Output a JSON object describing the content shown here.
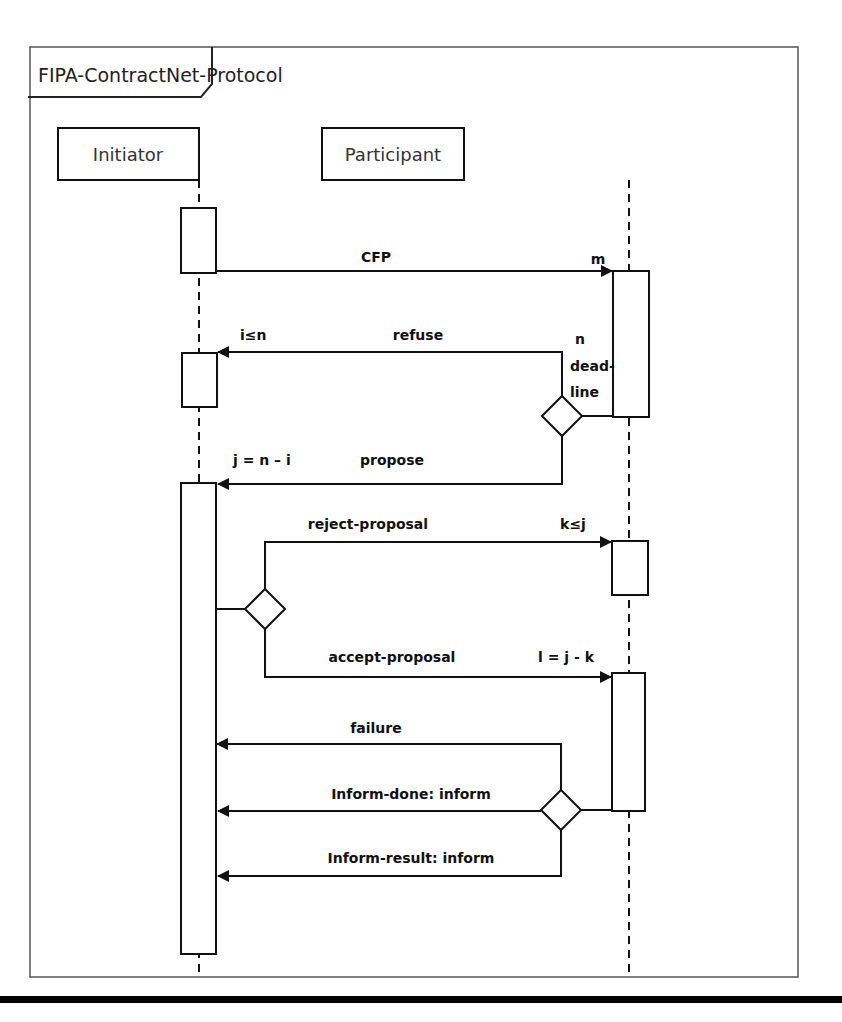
{
  "frame": {
    "title": "FIPA-ContractNet-Protocol"
  },
  "lifelines": [
    {
      "name": "Initiator"
    },
    {
      "name": "Participant"
    }
  ],
  "messages": {
    "cfp": {
      "label": "CFP",
      "multiplicity": "m"
    },
    "refuse": {
      "label": "refuse",
      "guard_left": "i≤n",
      "guard_right": "n"
    },
    "deadline": {
      "line1": "dead-",
      "line2": "line"
    },
    "propose": {
      "label": "propose",
      "guard_left": "j = n – i"
    },
    "reject": {
      "label": "reject-proposal",
      "guard_right": "k≤j"
    },
    "accept": {
      "label": "accept-proposal",
      "guard_right": "l = j - k"
    },
    "failure": {
      "label": "failure"
    },
    "inform_done": {
      "label": "Inform-done: inform"
    },
    "inform_result": {
      "label": "Inform-result: inform"
    }
  }
}
